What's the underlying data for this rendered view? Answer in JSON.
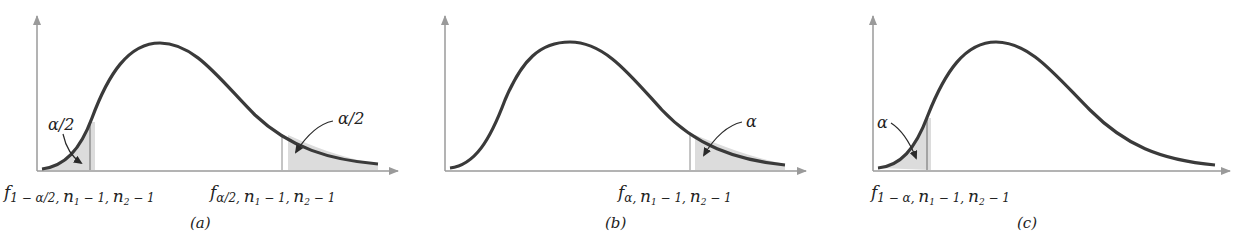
{
  "colors": {
    "curve": "#3a3a3a",
    "axis": "#9a9a9a",
    "shade": "#dcdcdc",
    "text": "#222222",
    "background": "#ffffff"
  },
  "panels": [
    {
      "id": "a",
      "caption": "(a)",
      "description": "F distribution with two-sided rejection regions",
      "tail_labels": [
        "α/2",
        "α/2"
      ],
      "lower_critical": {
        "f": "f",
        "sub": "1 − α/2, ",
        "n1": "n",
        "n1sub": "1",
        "mid": " − 1, ",
        "n2": "n",
        "n2sub": "2",
        "end": " − 1"
      },
      "upper_critical": {
        "f": "f",
        "sub": "α/2, ",
        "n1": "n",
        "n1sub": "1",
        "mid": " − 1, ",
        "n2": "n",
        "n2sub": "2",
        "end": " − 1"
      }
    },
    {
      "id": "b",
      "caption": "(b)",
      "description": "F distribution with upper-tail rejection region",
      "tail_labels": [
        "α"
      ],
      "upper_critical": {
        "f": "f",
        "sub": "α, ",
        "n1": "n",
        "n1sub": "1",
        "mid": " − 1, ",
        "n2": "n",
        "n2sub": "2",
        "end": " − 1"
      }
    },
    {
      "id": "c",
      "caption": "(c)",
      "description": "F distribution with lower-tail rejection region",
      "tail_labels": [
        "α"
      ],
      "lower_critical": {
        "f": "f",
        "sub": "1 − α, ",
        "n1": "n",
        "n1sub": "1",
        "mid": " − 1, ",
        "n2": "n",
        "n2sub": "2",
        "end": " − 1"
      }
    }
  ]
}
